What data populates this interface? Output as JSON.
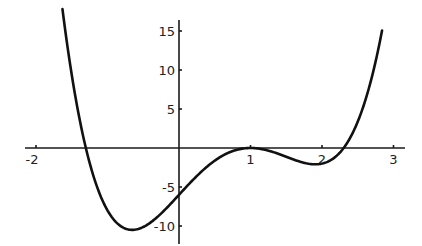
{
  "chart_data": {
    "type": "line",
    "title": "",
    "xlabel": "",
    "ylabel": "",
    "function": "f(x) = 2(x-1)^2 (x^2 - x - 3)",
    "xlim": [
      -2.15,
      3.15
    ],
    "ylim": [
      -12.3,
      16.3
    ],
    "grid": false,
    "legend": null,
    "x_ticks": [
      -2,
      1,
      2,
      3
    ],
    "x_tick_labels": [
      "-2",
      "1",
      "2",
      "3"
    ],
    "y_ticks": [
      15,
      10,
      5,
      -5,
      -10
    ],
    "y_tick_labels": [
      "15",
      "10",
      "5",
      "-5",
      "-10"
    ],
    "series": [
      {
        "name": "f(x)",
        "x": [
          -1.63,
          -1.5,
          -1.3,
          -1.0,
          -0.67,
          -0.5,
          0.0,
          0.5,
          1.0,
          1.5,
          2.0,
          2.3,
          2.5,
          2.84
        ],
        "y": [
          17.8,
          11.25,
          0.0,
          -8.0,
          -10.5,
          -10.1,
          -6.0,
          -1.62,
          0.0,
          -1.12,
          -2.0,
          0.0,
          2.25,
          15.1
        ]
      }
    ],
    "notable_points": {
      "y_intercept": -6,
      "roots": [
        -1.3,
        1.0,
        2.3
      ],
      "local_min_left": [
        -0.67,
        -10.5
      ],
      "local_max": [
        1.0,
        0.0
      ],
      "local_min_right": [
        2.0,
        -2.0
      ]
    }
  }
}
